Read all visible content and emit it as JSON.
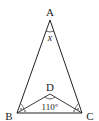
{
  "diagram": {
    "type": "geometry-triangle",
    "points": {
      "A": {
        "label": "A",
        "x": 50,
        "y": 20
      },
      "B": {
        "label": "B",
        "x": 17,
        "y": 113
      },
      "C": {
        "label": "C",
        "x": 82,
        "y": 113
      },
      "D": {
        "label": "D",
        "x": 50,
        "y": 94
      }
    },
    "angle_labels": {
      "apex": "x",
      "bdc": "110°"
    },
    "stroke_color": "#222222",
    "background": "#ffffff"
  }
}
